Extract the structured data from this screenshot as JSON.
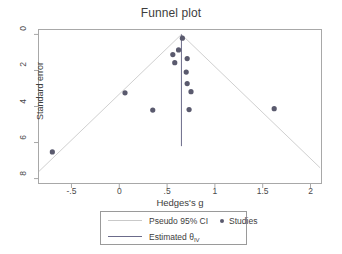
{
  "chart_data": {
    "type": "scatter",
    "title": "Funnel plot",
    "xlabel": "Hedges's g",
    "ylabel": "Standard error",
    "xlim": [
      -0.85,
      2.12
    ],
    "ylim": [
      8.3,
      -0.3
    ],
    "y_inverted": true,
    "grid": false,
    "xticks": [
      -0.5,
      0,
      0.5,
      1,
      1.5,
      2
    ],
    "xticklabels": [
      "-.5",
      "0",
      ".5",
      "1",
      "1.5",
      "2"
    ],
    "yticks": [
      0,
      2,
      4,
      6,
      8
    ],
    "yticklabels": [
      "0",
      "2",
      "4",
      "6",
      "8"
    ],
    "estimated_effect": 0.65,
    "series": [
      {
        "name": "Studies",
        "marker": "circle",
        "color": "#5a5a6e",
        "points": [
          {
            "x": -0.7,
            "y": 6.52
          },
          {
            "x": 0.06,
            "y": 3.24
          },
          {
            "x": 0.35,
            "y": 4.2
          },
          {
            "x": 0.56,
            "y": 1.12
          },
          {
            "x": 0.62,
            "y": 0.86
          },
          {
            "x": 0.58,
            "y": 1.57
          },
          {
            "x": 0.66,
            "y": 0.21
          },
          {
            "x": 0.71,
            "y": 1.34
          },
          {
            "x": 0.7,
            "y": 2.09
          },
          {
            "x": 0.71,
            "y": 2.73
          },
          {
            "x": 0.75,
            "y": 3.18
          },
          {
            "x": 0.73,
            "y": 4.17
          },
          {
            "x": 1.62,
            "y": 4.12
          }
        ]
      }
    ],
    "pseudo_ci": {
      "name": "Pseudo 95% CI",
      "color": "#d0d0d0",
      "apex": {
        "x": 0.65,
        "y": 0.0
      },
      "lower_left": {
        "x": -0.84,
        "y": 7.6
      },
      "lower_right": {
        "x": 2.1,
        "y": 7.4
      }
    }
  },
  "legend": {
    "pseudo_ci_label": "Pseudo 95% CI",
    "studies_label": "Studies",
    "estimated_label": "Estimated θ",
    "estimated_subscript": "IV"
  },
  "colors": {
    "marker": "#5a5a6e",
    "ci_line": "#d4d4d4",
    "estimate_line": "#6b6b8a",
    "frame": "#a8a8a8",
    "text": "#3d3d3d"
  }
}
